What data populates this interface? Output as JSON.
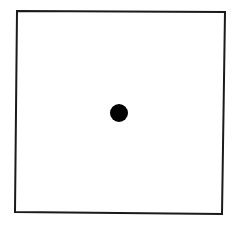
{
  "diagram": {
    "background_color": "#ffffff",
    "stroke_color": "#1a1a1a",
    "square": {
      "points": "17,11 225,12 222,214 15,212",
      "stroke_width": 2
    },
    "dot": {
      "cx": 119,
      "cy": 113,
      "r": 9,
      "fill": "#000000"
    }
  }
}
